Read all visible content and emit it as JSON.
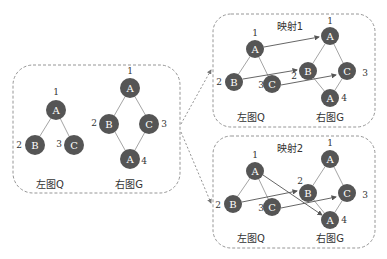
{
  "left_panel": {
    "graph_q": {
      "caption": "左图Q",
      "nodes": [
        {
          "label": "A",
          "num": "1"
        },
        {
          "label": "B",
          "num": "2"
        },
        {
          "label": "C",
          "num": "3"
        }
      ]
    },
    "graph_g": {
      "caption": "右图G",
      "nodes": [
        {
          "label": "A",
          "num": "1"
        },
        {
          "label": "B",
          "num": "2"
        },
        {
          "label": "C",
          "num": "3"
        },
        {
          "label": "A",
          "num": "4"
        }
      ]
    }
  },
  "mapping1": {
    "title": "映射1",
    "graph_q": {
      "caption": "左图Q",
      "nodes": [
        {
          "label": "A",
          "num": "1"
        },
        {
          "label": "B",
          "num": "2"
        },
        {
          "label": "C",
          "num": "3"
        }
      ]
    },
    "graph_g": {
      "caption": "右图G",
      "nodes": [
        {
          "label": "A",
          "num": "1"
        },
        {
          "label": "B",
          "num": "2"
        },
        {
          "label": "C",
          "num": "3"
        },
        {
          "label": "A",
          "num": "4"
        }
      ]
    },
    "arrows": [
      "Q.A1→G.A1",
      "Q.B2→G.B2",
      "Q.C3→G.C3"
    ]
  },
  "mapping2": {
    "title": "映射2",
    "graph_q": {
      "caption": "左图Q",
      "nodes": [
        {
          "label": "A",
          "num": "1"
        },
        {
          "label": "B",
          "num": "2"
        },
        {
          "label": "C",
          "num": "3"
        }
      ]
    },
    "graph_g": {
      "caption": "右图G",
      "nodes": [
        {
          "label": "A",
          "num": "1"
        },
        {
          "label": "B",
          "num": "2"
        },
        {
          "label": "C",
          "num": "3"
        },
        {
          "label": "A",
          "num": "4"
        }
      ]
    },
    "arrows": [
      "Q.A1→G.A4",
      "Q.B2→G.B2",
      "Q.C3→G.C3"
    ]
  },
  "colors": {
    "node": "#555555",
    "edge": "#9a9a9a",
    "box": "#8a8a8a"
  }
}
